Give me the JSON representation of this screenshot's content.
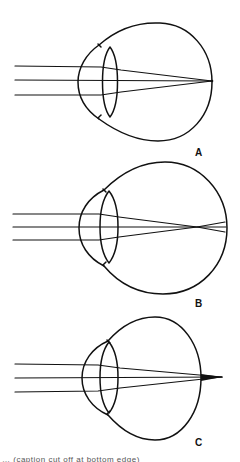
{
  "figure": {
    "type": "diagram",
    "stroke_color": "#111111",
    "background": "#ffffff",
    "panels": [
      {
        "id": "A",
        "label": "A",
        "focus": "on retina",
        "globe": {
          "cx": 156,
          "cy": 82,
          "rx": 56,
          "ry": 59
        },
        "cornea_left_x": 78,
        "lens": {
          "left": 100,
          "right": 121,
          "top": 47,
          "bottom": 117
        },
        "rays_y": [
          66,
          80,
          95
        ],
        "ray_start_x": 15,
        "focal_point": {
          "x": 212,
          "y": 81
        }
      },
      {
        "id": "B",
        "label": "B",
        "focus": "in front of retina",
        "globe": {
          "cx": 163,
          "cy": 228,
          "rx": 64,
          "ry": 66
        },
        "cornea_left_x": 79,
        "lens": {
          "left": 98,
          "right": 119,
          "top": 191,
          "bottom": 263
        },
        "rays_y": [
          214,
          227,
          240
        ],
        "ray_start_x": 13,
        "focal_point": {
          "x": 197,
          "y": 227
        }
      },
      {
        "id": "C",
        "label": "C",
        "focus": "behind retina",
        "globe": {
          "cx": 152,
          "cy": 378,
          "rx": 49,
          "ry": 61
        },
        "cornea_left_x": 82,
        "lens": {
          "left": 98,
          "right": 120,
          "top": 342,
          "bottom": 413
        },
        "rays_y": [
          364,
          378,
          392
        ],
        "ray_start_x": 15,
        "focal_point": {
          "x": 222,
          "y": 377
        }
      }
    ],
    "caption": "… (caption cut off at bottom edge)"
  }
}
